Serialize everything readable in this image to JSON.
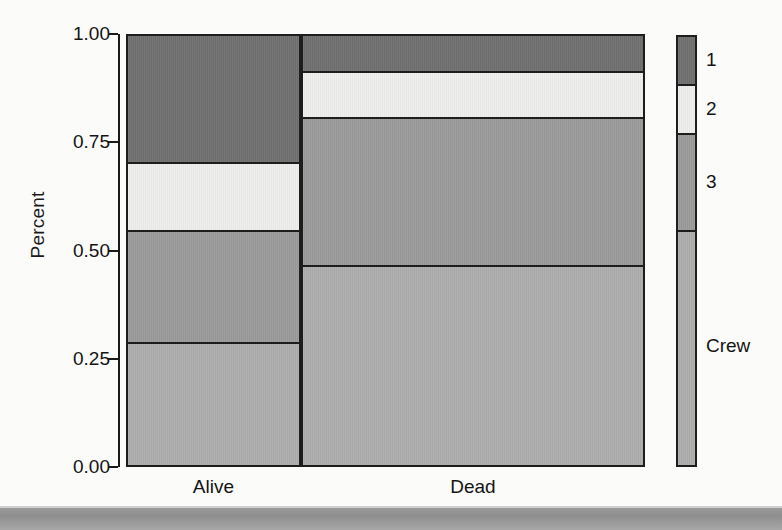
{
  "chart_data": {
    "type": "bar",
    "subtype": "stacked-100-percent-spineplot",
    "title": "",
    "subtitle": "",
    "xlabel": "",
    "ylabel": "Percent",
    "categories": [
      "Alive",
      "Dead"
    ],
    "category_widths": [
      0.337,
      0.663
    ],
    "ylim": [
      0.0,
      1.0
    ],
    "yticks": [
      "0.00",
      "0.25",
      "0.50",
      "0.75",
      "1.00"
    ],
    "ytick_values": [
      0.0,
      0.25,
      0.5,
      0.75,
      1.0
    ],
    "grid": false,
    "legend_position": "right",
    "legend_style": "vertical-color-bar",
    "stack_order_top_to_bottom": [
      "1",
      "2",
      "3",
      "Crew"
    ],
    "series": [
      {
        "name": "1",
        "label": "1",
        "color": "#6f6f6f",
        "values": [
          0.299,
          0.086
        ]
      },
      {
        "name": "2",
        "label": "2",
        "color": "#eeeeec",
        "values": [
          0.159,
          0.108
        ]
      },
      {
        "name": "3",
        "label": "3",
        "color": "#9a9a9a",
        "values": [
          0.26,
          0.345
        ]
      },
      {
        "name": "Crew",
        "label": "Crew",
        "color": "#adadad",
        "values": [
          0.282,
          0.461
        ]
      }
    ],
    "stack_boundaries": {
      "Alive": [
        0.282,
        0.542,
        0.701,
        1.0
      ],
      "Dead": [
        0.461,
        0.806,
        0.914,
        1.0
      ]
    },
    "annotations": []
  },
  "axis": {
    "y_title": "Percent",
    "y_ticks": [
      {
        "label": "1.00",
        "value": 1.0
      },
      {
        "label": "0.75",
        "value": 0.75
      },
      {
        "label": "0.50",
        "value": 0.5
      },
      {
        "label": "0.25",
        "value": 0.25
      },
      {
        "label": "0.00",
        "value": 0.0
      }
    ],
    "x_ticks": [
      {
        "label": "Alive"
      },
      {
        "label": "Dead"
      }
    ]
  },
  "legend": {
    "items": [
      {
        "label": "1",
        "color": "#6f6f6f"
      },
      {
        "label": "2",
        "color": "#eeeeec"
      },
      {
        "label": "3",
        "color": "#9a9a9a"
      },
      {
        "label": "Crew",
        "color": "#adadad"
      }
    ]
  },
  "colors": {
    "axis": "#1a1a1a",
    "text": "#141414",
    "background": "#fbfbfa",
    "page_edge": "#9a9a9a"
  }
}
